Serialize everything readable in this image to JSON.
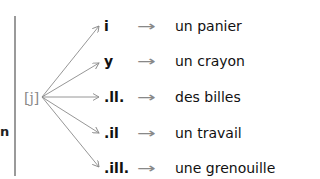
{
  "diagram": {
    "left_fragment": "n",
    "phoneme": "[j]",
    "rows": [
      {
        "grapheme": "i",
        "arrow": "→",
        "example": "un panier"
      },
      {
        "grapheme": "y",
        "arrow": "→",
        "example": "un crayon"
      },
      {
        "grapheme": ".ll.",
        "arrow": "→",
        "example": "des billes"
      },
      {
        "grapheme": ".il",
        "arrow": "→",
        "example": "un travail"
      },
      {
        "grapheme": ".ill.",
        "arrow": "→",
        "example": "une grenouille"
      }
    ],
    "colors": {
      "divider": "#9a9a9a",
      "arrows": "#8a8a8a",
      "text": "#111111"
    }
  }
}
